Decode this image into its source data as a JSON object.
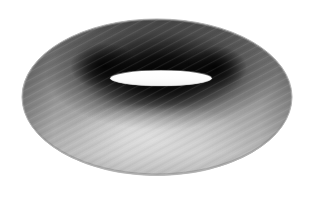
{
  "scene": {
    "title": "Torus",
    "object_name": "torus",
    "rendering": "shaded-grayscale-polygon-mesh",
    "background_color": "#ffffff",
    "canvas_width": 316,
    "canvas_height": 201
  },
  "geometry": {
    "outer_ellipse": {
      "cx": 157,
      "cy": 97,
      "rx": 135,
      "ry": 78
    },
    "inner_hole_ellipse": {
      "cx": 161,
      "cy": 78,
      "rx": 51,
      "ry": 8
    },
    "tube_band": {
      "cx": 157,
      "cy": 86,
      "rx": 98,
      "ry": 33
    }
  },
  "shading": {
    "highlight_color": "#ffffff",
    "light_gray": "#d2d2d2",
    "mid_gray": "#9a9a9a",
    "body_gray": "#8a8a8a",
    "dark_gray": "#4a4a4a",
    "deep_shadow": "#181818",
    "rim_shadow": "#2a2a2a",
    "outline_color": "#6e6e6e",
    "hole_fill": "#fbfbfb"
  },
  "hotspots": {
    "inner_left_shadow": {
      "cx": 104,
      "cy": 66,
      "r": 26,
      "color": "#101010"
    },
    "inner_right_shadow": {
      "cx": 215,
      "cy": 68,
      "r": 24,
      "color": "#121212"
    },
    "top_rim_shade": {
      "cx": 157,
      "cy": 30,
      "color": "#5f5f5f"
    },
    "lower_body_light": {
      "cx": 150,
      "cy": 140,
      "color": "#c9c9c9"
    },
    "left_outer_mid": {
      "cx": 45,
      "cy": 105,
      "color": "#8c8c8c"
    },
    "right_outer_mid": {
      "cx": 272,
      "cy": 105,
      "color": "#969696"
    }
  },
  "texture": {
    "type": "diagonal-facet-banding",
    "angle_deg": -28,
    "opacity": 0.085,
    "period_px": 5
  }
}
